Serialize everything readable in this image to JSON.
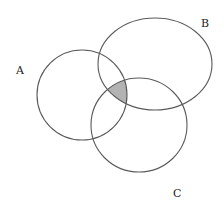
{
  "diagram": {
    "type": "venn-3-sets",
    "sets": [
      {
        "id": "A",
        "label": "A",
        "cx": 82,
        "cy": 95,
        "rx": 45,
        "ry": 45,
        "label_x": 16,
        "label_y": 74
      },
      {
        "id": "B",
        "label": "B",
        "cx": 155,
        "cy": 64,
        "rx": 57,
        "ry": 46,
        "label_x": 201,
        "label_y": 27
      },
      {
        "id": "C",
        "label": "C",
        "cx": 139,
        "cy": 125,
        "rx": 48,
        "ry": 47,
        "label_x": 173,
        "label_y": 197
      }
    ],
    "shaded_region": {
      "description": "A ∩ B ∩ C",
      "fill": "#b3b3b3"
    },
    "colors": {
      "stroke": "#5a5a5a",
      "background": "#ffffff",
      "label": "#222222"
    }
  }
}
